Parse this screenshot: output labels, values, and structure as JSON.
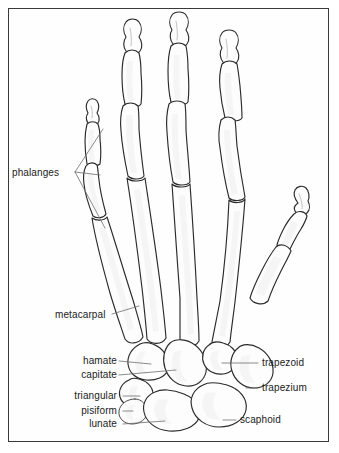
{
  "figure": {
    "background_color": "#ffffff",
    "border_color": "#3a3a3a",
    "bone_fill": "#fdfdfd",
    "bone_outline": "#2b2b2b",
    "leader_color": "#6d6d6d",
    "text_color": "#1b1b1b"
  },
  "labels": {
    "phalanges": "phalanges",
    "metacarpal": "metacarpal",
    "hamate": "hamate",
    "capitate": "capitate",
    "triangular": "triangular",
    "pisiform": "pisiform",
    "lunate": "lunate",
    "trapezoid": "trapezoid",
    "trapezium": "trapezium",
    "scaphoid": "scaphoid"
  }
}
